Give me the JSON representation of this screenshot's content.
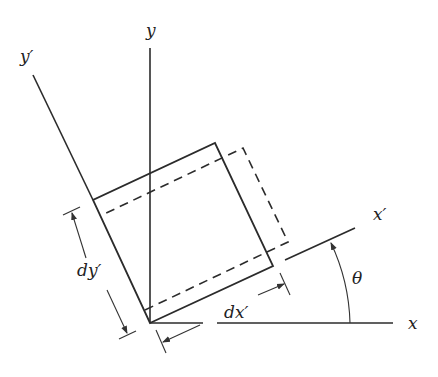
{
  "figure": {
    "type": "element rotation diagram",
    "labels": {
      "y_axis": "y",
      "x_axis": "x",
      "y_prime_axis": "y′",
      "x_prime_axis": "x′",
      "dy_prime": "dy′",
      "dx_prime": "dx′",
      "angle": "θ"
    },
    "colors": {
      "element_fill": "#d4d4d4",
      "line": "#2b2b2b",
      "background": "#ffffff"
    },
    "elements": {
      "shaded_element": "rotated differential element dx′ × dy′",
      "dashed_outline": "deformed element outline",
      "angle_arc": "rotation angle θ from x to x′"
    }
  }
}
